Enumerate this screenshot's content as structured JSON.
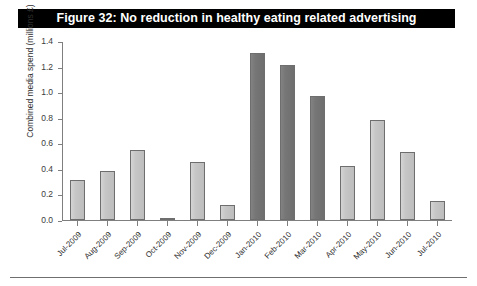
{
  "figure": {
    "title": "Figure 32: No reduction in healthy eating related advertising"
  },
  "colors": {
    "title_bar_background": "#000000",
    "title_bar_text": "#ffffff",
    "bar_light": "#c6c6c6",
    "bar_dark": "#767676",
    "bar_border": "#6e6e6e",
    "axis": "#7f7f7f"
  },
  "chart_data": {
    "type": "bar",
    "title": "Figure 32: No reduction in healthy eating related advertising",
    "xlabel": "",
    "ylabel": "Combined media spend (millions £)",
    "ylim": [
      0.0,
      1.4
    ],
    "ytick_labels": [
      "1.4",
      "1.2",
      "1.0",
      "0.8",
      "0.6",
      "0.4",
      "0.2",
      "0.0"
    ],
    "yticks": [
      1.4,
      1.2,
      1.0,
      0.8,
      0.6,
      0.4,
      0.2,
      0.0
    ],
    "grid": false,
    "legend": null,
    "categories": [
      "Jul-2009",
      "Aug-2009",
      "Sep-2009",
      "Oct-2009",
      "Nov-2009",
      "Dec-2009",
      "Jan-2010",
      "Feb-2010",
      "Mar-2010",
      "Apr-2010",
      "May-2010",
      "Jun-2010",
      "Jul-2010"
    ],
    "values": [
      0.31,
      0.38,
      0.55,
      0.01,
      0.45,
      0.12,
      1.31,
      1.21,
      0.97,
      0.42,
      0.78,
      0.53,
      0.15
    ],
    "bar_shades": [
      "light",
      "light",
      "light",
      "light",
      "light",
      "light",
      "dark",
      "dark",
      "dark",
      "light",
      "light",
      "light",
      "light"
    ]
  }
}
